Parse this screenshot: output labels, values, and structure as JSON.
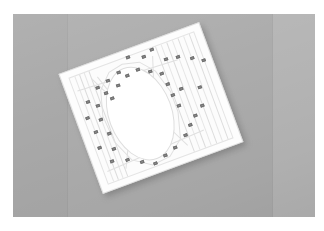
{
  "scene": {
    "title": "White slatted panel with oval opening on gray backdrop",
    "subject": "rotated rectangular white board with oval cut-out and numbered markers",
    "capture_type": "photograph",
    "rotation_degrees": -20.3,
    "image_width": 324,
    "image_height": 231
  },
  "colors": {
    "page_background": "#ffffff",
    "backdrop_left": "#a8a8a8",
    "backdrop_center": "#acacac",
    "backdrop_right": "#b6b6b6",
    "backdrop_seam": "#9b9b9b",
    "panel_white": "#fdfdfd",
    "panel_line": "#e4e4e4",
    "oval_outline": "#dedede",
    "marker_fill": "#8e8e8e",
    "marker_border": "#6f6f6f",
    "shadow": "rgba(60,60,60,0.30)"
  },
  "backdrop": {
    "name": "studio-backdrop",
    "left_px": 13,
    "top_px": 14,
    "width_px": 302,
    "height_px": 203,
    "panels": [
      {
        "name": "backdrop-panel-left",
        "left_px": 0,
        "width_px": 54,
        "color": "#a8a8a8"
      },
      {
        "name": "backdrop-panel-center",
        "left_px": 54,
        "width_px": 205,
        "color": "#acacac"
      },
      {
        "name": "backdrop-panel-right",
        "left_px": 259,
        "width_px": 43,
        "color": "#b6b6b6"
      }
    ],
    "seams_px": [
      54,
      259
    ]
  },
  "panel": {
    "name": "white-slatted-panel",
    "wrap_left_px": 63,
    "wrap_top_px": 30,
    "width_px": 150,
    "height_px": 128,
    "corners_px": {
      "top_left": [
        75,
        80
      ],
      "top_right": [
        213,
        30
      ],
      "bottom_right": [
        255,
        148
      ],
      "bottom_left": [
        118,
        195
      ]
    },
    "slats": [
      {
        "x_px": 14,
        "strong": false
      },
      {
        "x_px": 19,
        "strong": true
      },
      {
        "x_px": 24,
        "strong": false
      },
      {
        "x_px": 29,
        "strong": true
      },
      {
        "x_px": 100,
        "strong": true
      },
      {
        "x_px": 106,
        "strong": false
      },
      {
        "x_px": 112,
        "strong": true
      },
      {
        "x_px": 118,
        "strong": false
      },
      {
        "x_px": 124,
        "strong": true
      },
      {
        "x_px": 130,
        "strong": false
      },
      {
        "x_px": 136,
        "strong": true
      }
    ],
    "braces": [
      {
        "x_px": 30,
        "y_px": 16,
        "length_px": 36,
        "angle_deg": 64
      },
      {
        "x_px": 36,
        "y_px": 16,
        "length_px": 40,
        "angle_deg": 72
      },
      {
        "x_px": 95,
        "y_px": 16,
        "length_px": 40,
        "angle_deg": 108
      },
      {
        "x_px": 30,
        "y_px": 112,
        "length_px": 36,
        "angle_deg": -64
      },
      {
        "x_px": 96,
        "y_px": 112,
        "length_px": 36,
        "angle_deg": -116
      },
      {
        "x_px": 12,
        "y_px": 22,
        "length_px": 105,
        "angle_deg": 3
      },
      {
        "x_px": 12,
        "y_px": 108,
        "length_px": 105,
        "angle_deg": -3
      }
    ]
  },
  "oval": {
    "name": "oval-opening",
    "left_px": 31,
    "top_px": 17,
    "width_px": 62,
    "height_px": 95,
    "outline_color": "#dedede"
  },
  "oval_ring": {
    "name": "oval-polygon-ring",
    "points": "39,2 56,6 68,20 75,44 75,66 68,92 52,105 33,107 15,95 5,72 3,44 10,19 24,5"
  },
  "markers": {
    "name": "calibration-markers",
    "count": 40,
    "list": [
      {
        "id": "1",
        "x_px": 69,
        "y_px": 7
      },
      {
        "id": "2",
        "x_px": 84,
        "y_px": 12
      },
      {
        "id": "3",
        "x_px": 94,
        "y_px": 8
      },
      {
        "id": "4",
        "x_px": 104,
        "y_px": 22
      },
      {
        "id": "5",
        "x_px": 116,
        "y_px": 24
      },
      {
        "id": "6",
        "x_px": 129,
        "y_px": 30
      },
      {
        "id": "7",
        "x_px": 139,
        "y_px": 36
      },
      {
        "id": "8",
        "x_px": 30,
        "y_px": 25
      },
      {
        "id": "9",
        "x_px": 42,
        "y_px": 22
      },
      {
        "id": "10",
        "x_px": 55,
        "y_px": 18
      },
      {
        "id": "11",
        "x_px": 16,
        "y_px": 35
      },
      {
        "id": "12",
        "x_px": 24,
        "y_px": 42
      },
      {
        "id": "13",
        "x_px": 36,
        "y_px": 33
      },
      {
        "id": "14",
        "x_px": 10,
        "y_px": 50
      },
      {
        "id": "15",
        "x_px": 22,
        "y_px": 56
      },
      {
        "id": "16",
        "x_px": 13,
        "y_px": 66
      },
      {
        "id": "17",
        "x_px": 25,
        "y_px": 72
      },
      {
        "id": "18",
        "x_px": 11,
        "y_px": 82
      },
      {
        "id": "19",
        "x_px": 24,
        "y_px": 88
      },
      {
        "id": "20",
        "x_px": 18,
        "y_px": 99
      },
      {
        "id": "21",
        "x_px": 33,
        "y_px": 103
      },
      {
        "id": "22",
        "x_px": 46,
        "y_px": 110
      },
      {
        "id": "23",
        "x_px": 58,
        "y_px": 116
      },
      {
        "id": "24",
        "x_px": 70,
        "y_px": 112
      },
      {
        "id": "25",
        "x_px": 82,
        "y_px": 108
      },
      {
        "id": "26",
        "x_px": 96,
        "y_px": 100
      },
      {
        "id": "27",
        "x_px": 104,
        "y_px": 92
      },
      {
        "id": "28",
        "x_px": 112,
        "y_px": 85
      },
      {
        "id": "29",
        "x_px": 122,
        "y_px": 78
      },
      {
        "id": "30",
        "x_px": 100,
        "y_px": 70
      },
      {
        "id": "31",
        "x_px": 98,
        "y_px": 58
      },
      {
        "id": "32",
        "x_px": 97,
        "y_px": 46
      },
      {
        "id": "33",
        "x_px": 95,
        "y_px": 34
      },
      {
        "id": "34",
        "x_px": 85,
        "y_px": 28
      },
      {
        "id": "35",
        "x_px": 74,
        "y_px": 22
      },
      {
        "id": "36",
        "x_px": 62,
        "y_px": 24
      },
      {
        "id": "37",
        "x_px": 50,
        "y_px": 30
      },
      {
        "id": "38",
        "x_px": 40,
        "y_px": 40
      },
      {
        "id": "39",
        "x_px": 108,
        "y_px": 55
      },
      {
        "id": "40",
        "x_px": 126,
        "y_px": 60
      }
    ]
  }
}
